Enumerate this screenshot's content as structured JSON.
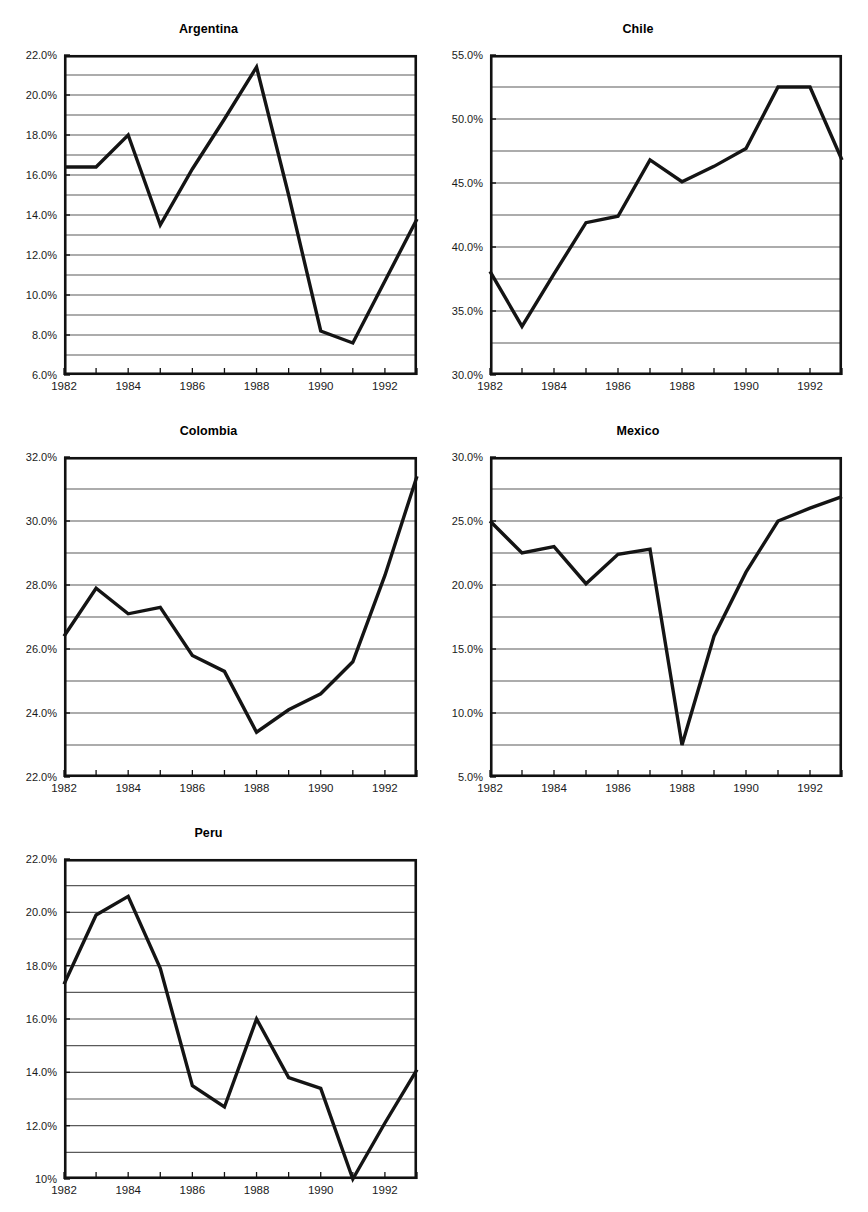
{
  "figure": {
    "caption_fragment": "",
    "x_tick_years": [
      1982,
      1983,
      1984,
      1985,
      1986,
      1987,
      1988,
      1989,
      1990,
      1991,
      1992,
      1993
    ],
    "x_labels": [
      "1982",
      "1984",
      "1986",
      "1988",
      "1990",
      "1992"
    ],
    "line_color": "#141414",
    "grid_color": "#5a5a5a",
    "frame_color": "#111111"
  },
  "chart_data": [
    {
      "type": "line",
      "title": "Argentina",
      "xlabel": "",
      "ylabel": "",
      "x": [
        1982,
        1983,
        1984,
        1985,
        1986,
        1987,
        1988,
        1989,
        1990,
        1991,
        1992,
        1993
      ],
      "values": [
        16.4,
        16.4,
        18.0,
        13.5,
        16.3,
        18.8,
        21.4,
        15.0,
        8.2,
        7.6,
        10.7,
        13.8
      ],
      "ylim": [
        6.0,
        22.0
      ],
      "ytick_step": 2.0,
      "grid_step": 1.0,
      "ytick_labels": [
        "6.0%",
        "8.0%",
        "10.0%",
        "12.0%",
        "14.0%",
        "16.0%",
        "18.0%",
        "20.0%",
        "22.0%"
      ],
      "xlim": [
        1982,
        1993
      ],
      "grid": true,
      "legend": "none"
    },
    {
      "type": "line",
      "title": "Chile",
      "xlabel": "",
      "ylabel": "",
      "x": [
        1982,
        1983,
        1984,
        1985,
        1986,
        1987,
        1988,
        1989,
        1990,
        1991,
        1992,
        1993
      ],
      "values": [
        38.1,
        33.8,
        37.9,
        41.9,
        42.4,
        46.8,
        45.1,
        46.3,
        47.7,
        52.5,
        52.5,
        46.8
      ],
      "ylim": [
        30.0,
        55.0
      ],
      "ytick_step": 5.0,
      "grid_step": 2.5,
      "ytick_labels": [
        "30.0%",
        "35.0%",
        "40.0%",
        "45.0%",
        "50.0%",
        "55.0%"
      ],
      "xlim": [
        1982,
        1993
      ],
      "grid": true,
      "legend": "none"
    },
    {
      "type": "line",
      "title": "Colombia",
      "xlabel": "",
      "ylabel": "",
      "x": [
        1982,
        1983,
        1984,
        1985,
        1986,
        1987,
        1988,
        1989,
        1990,
        1991,
        1992,
        1993
      ],
      "values": [
        26.4,
        27.9,
        27.1,
        27.3,
        25.8,
        25.3,
        23.4,
        24.1,
        24.6,
        25.6,
        28.3,
        31.4
      ],
      "ylim": [
        22.0,
        32.0
      ],
      "ytick_step": 2.0,
      "grid_step": 1.0,
      "ytick_labels": [
        "22.0%",
        "24.0%",
        "26.0%",
        "28.0%",
        "30.0%",
        "32.0%"
      ],
      "xlim": [
        1982,
        1993
      ],
      "grid": true,
      "legend": "none"
    },
    {
      "type": "line",
      "title": "Mexico",
      "xlabel": "",
      "ylabel": "",
      "x": [
        1982,
        1983,
        1984,
        1985,
        1986,
        1987,
        1988,
        1989,
        1990,
        1991,
        1992,
        1993
      ],
      "values": [
        25.0,
        22.5,
        23.0,
        20.1,
        22.4,
        22.8,
        7.5,
        16.0,
        21.0,
        25.0,
        26.0,
        26.9
      ],
      "ylim": [
        5.0,
        30.0
      ],
      "ytick_step": 5.0,
      "grid_step": 2.5,
      "ytick_labels": [
        "5.0%",
        "10.0%",
        "15.0%",
        "20.0%",
        "25.0%",
        "30.0%"
      ],
      "xlim": [
        1982,
        1993
      ],
      "grid": true,
      "legend": "none"
    },
    {
      "type": "line",
      "title": "Peru",
      "xlabel": "",
      "ylabel": "",
      "x": [
        1982,
        1983,
        1984,
        1985,
        1986,
        1987,
        1988,
        1989,
        1990,
        1991,
        1992,
        1993
      ],
      "values": [
        17.3,
        19.9,
        20.6,
        17.9,
        13.5,
        12.7,
        16.0,
        13.8,
        13.4,
        10.0,
        12.1,
        14.1
      ],
      "ylim": [
        10.0,
        22.0
      ],
      "ytick_step": 2.0,
      "grid_step": 1.0,
      "ytick_labels": [
        "10%",
        "12.0%",
        "14.0%",
        "16.0%",
        "18.0%",
        "20.0%",
        "22.0%"
      ],
      "xlim": [
        1982,
        1993
      ],
      "grid": true,
      "legend": "none"
    }
  ],
  "panels": [
    {
      "key": "argentina",
      "left": 0,
      "top": 22,
      "plot_left": 64,
      "plot_top": 33,
      "plot_w": 353,
      "plot_h": 320
    },
    {
      "key": "chile",
      "left": 434,
      "top": 22,
      "plot_left": 56,
      "plot_top": 33,
      "plot_w": 352,
      "plot_h": 320
    },
    {
      "key": "colombia",
      "left": 0,
      "top": 424,
      "plot_left": 64,
      "plot_top": 33,
      "plot_w": 353,
      "plot_h": 320
    },
    {
      "key": "mexico",
      "left": 434,
      "top": 424,
      "plot_left": 56,
      "plot_top": 33,
      "plot_w": 352,
      "plot_h": 320
    },
    {
      "key": "peru",
      "left": 0,
      "top": 826,
      "plot_left": 64,
      "plot_top": 33,
      "plot_w": 353,
      "plot_h": 320
    }
  ]
}
